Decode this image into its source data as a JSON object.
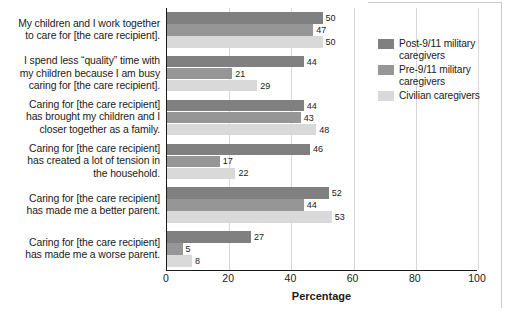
{
  "chart_data": {
    "type": "bar",
    "orientation": "horizontal",
    "title": "",
    "xlabel": "Percentage",
    "ylabel": "",
    "xlim": [
      0,
      100
    ],
    "xticks": [
      0,
      20,
      40,
      60,
      80,
      100
    ],
    "grid": true,
    "legend_position": "right",
    "categories": [
      "My children and I work together to care for [the care recipient].",
      "I spend less “quality” time with my children because I am busy caring for [the care recipient].",
      "Caring for [the care recipient] has brought my children and I closer together as a family.",
      "Caring for [the care recipient] has created a lot of tension in the household.",
      "Caring for [the care recipient] has made me a better parent.",
      "Caring for [the care recipient] has made me a worse parent."
    ],
    "category_lines": [
      [
        "My children and I work together",
        "to care for [the care recipient]."
      ],
      [
        "I spend less “quality” time with",
        "my children because I am busy",
        "caring for [the care recipient]."
      ],
      [
        "Caring for [the care recipient]",
        "has brought my children and I",
        "closer together as a family."
      ],
      [
        "Caring for [the care recipient]",
        "has created a lot of tension in",
        "the household."
      ],
      [
        "Caring for [the care recipient]",
        "has made me a better parent."
      ],
      [
        "Caring for [the care recipient]",
        "has made me a worse parent."
      ]
    ],
    "series": [
      {
        "name": "Post-9/11 military caregivers",
        "name_lines": [
          "Post-9/11 military",
          "caregivers"
        ],
        "color": "#808080",
        "values": [
          50,
          44,
          44,
          46,
          52,
          27
        ]
      },
      {
        "name": "Pre-9/11 military caregivers",
        "name_lines": [
          "Pre-9/11 military",
          "caregivers"
        ],
        "color": "#969696",
        "values": [
          47,
          21,
          43,
          17,
          44,
          5
        ]
      },
      {
        "name": "Civilian caregivers",
        "name_lines": [
          "Civilian caregivers"
        ],
        "color": "#d9d9d9",
        "values": [
          50,
          29,
          48,
          22,
          53,
          8
        ]
      }
    ]
  },
  "axis": {
    "x_tick_labels": [
      "0",
      "20",
      "40",
      "60",
      "80",
      "100"
    ],
    "x_title": "Percentage"
  },
  "colors": {
    "post911": "#808080",
    "pre911": "#969696",
    "civilian": "#d9d9d9",
    "axis": "#1a1a1a",
    "grid": "#d8d8d8",
    "text": "#1a1a1a"
  }
}
